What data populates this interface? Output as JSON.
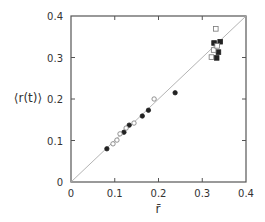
{
  "chart_data": {
    "type": "scatter",
    "title": "",
    "xlabel": "r̄",
    "ylabel": "⟨r(t)⟩",
    "xlim": [
      0,
      0.4
    ],
    "ylim": [
      0,
      0.4
    ],
    "grid": false,
    "legend": null,
    "x_ticks": [
      "0",
      "0.1",
      "0.2",
      "0.3",
      "0.4"
    ],
    "y_ticks": [
      "0",
      "0.1",
      "0.2",
      "0.3",
      "0.4"
    ],
    "reference_line": {
      "type": "diagonal",
      "from": [
        0,
        0
      ],
      "to": [
        0.4,
        0.4
      ]
    },
    "series": [
      {
        "name": "filled circles",
        "marker": "circle",
        "fill": "filled",
        "points": [
          [
            0.082,
            0.08
          ],
          [
            0.121,
            0.12
          ],
          [
            0.133,
            0.137
          ],
          [
            0.163,
            0.159
          ],
          [
            0.177,
            0.173
          ],
          [
            0.238,
            0.215
          ]
        ]
      },
      {
        "name": "open circles",
        "marker": "circle",
        "fill": "open",
        "points": [
          [
            0.096,
            0.092
          ],
          [
            0.105,
            0.101
          ],
          [
            0.112,
            0.116
          ],
          [
            0.126,
            0.13
          ],
          [
            0.144,
            0.142
          ],
          [
            0.19,
            0.2
          ]
        ]
      },
      {
        "name": "filled squares",
        "marker": "square",
        "fill": "filled",
        "points": [
          [
            0.327,
            0.335
          ],
          [
            0.341,
            0.338
          ],
          [
            0.337,
            0.313
          ],
          [
            0.333,
            0.299
          ]
        ]
      },
      {
        "name": "open squares",
        "marker": "square",
        "fill": "open",
        "points": [
          [
            0.331,
            0.369
          ],
          [
            0.326,
            0.318
          ],
          [
            0.334,
            0.328
          ],
          [
            0.321,
            0.301
          ]
        ]
      }
    ]
  },
  "labels": {
    "xlabel": "r̄",
    "ylabel": "⟨r(t)⟩"
  }
}
